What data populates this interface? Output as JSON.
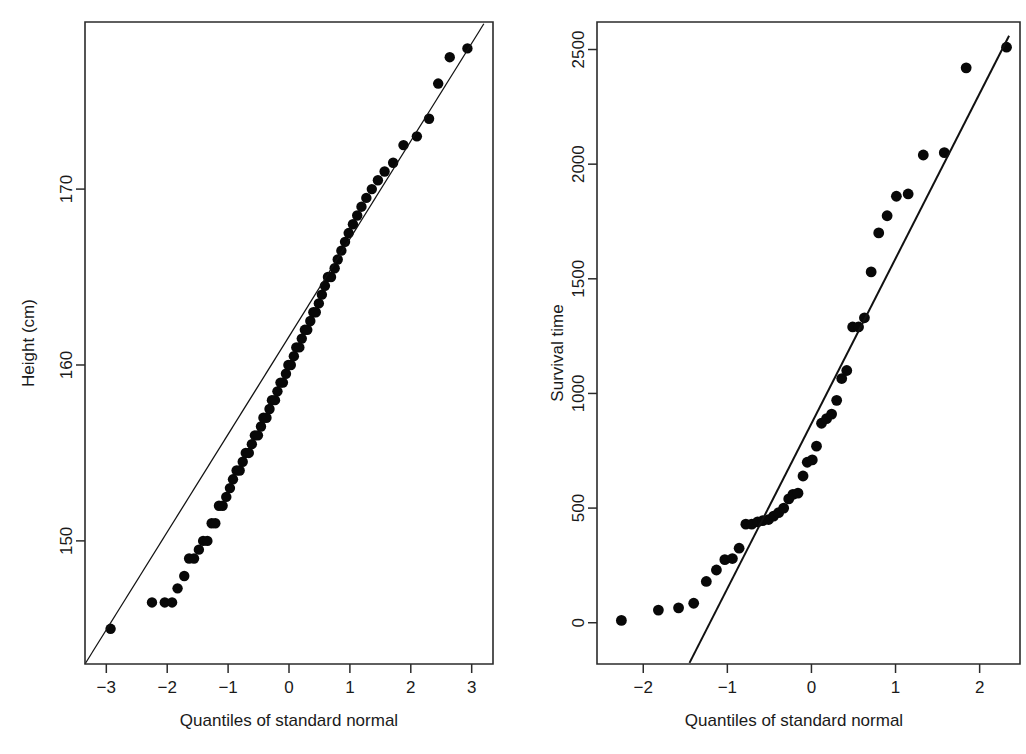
{
  "figure": {
    "background_color": "#ffffff",
    "foreground_color": "#1a1a1a",
    "point_color": "#080808",
    "panels": 2
  },
  "left_panel": {
    "name": "height-qq-plot",
    "x_axis_title": "Quantiles of standard normal",
    "y_axis_title": "Height (cm)",
    "x_tick_labels": [
      "-3",
      "-2",
      "-1",
      "0",
      "1",
      "2",
      "3"
    ],
    "y_tick_labels": [
      "150",
      "160",
      "170"
    ]
  },
  "right_panel": {
    "name": "survival-time-qq-plot",
    "x_axis_title": "Quantiles of standard normal",
    "y_axis_title": "Survival time",
    "x_tick_labels": [
      "-2",
      "-1",
      "0",
      "1",
      "2"
    ],
    "y_tick_labels": [
      "0",
      "500",
      "1000",
      "1500",
      "2000",
      "2500"
    ]
  },
  "chart_data": [
    {
      "type": "scatter",
      "title": "",
      "panel": "left",
      "xlabel": "Quantiles of standard normal",
      "ylabel": "Height (cm)",
      "xlim": [
        -3.35,
        3.35
      ],
      "ylim": [
        143.0,
        179.5
      ],
      "xticks": [
        -3,
        -2,
        -1,
        0,
        1,
        2,
        3
      ],
      "yticks": [
        150,
        160,
        170
      ],
      "grid": false,
      "legend": "none",
      "reference_line": {
        "type": "qq-line",
        "x_start": -3.35,
        "y_start": 143.0,
        "x_end": 3.2,
        "y_end": 179.4,
        "slope": 5.56,
        "intercept": 161.6
      },
      "x": [
        -2.93,
        -2.25,
        -2.04,
        -1.92,
        -1.83,
        -1.72,
        -1.64,
        -1.56,
        -1.48,
        -1.41,
        -1.34,
        -1.27,
        -1.21,
        -1.15,
        -1.09,
        -1.03,
        -0.97,
        -0.92,
        -0.86,
        -0.81,
        -0.76,
        -0.71,
        -0.66,
        -0.61,
        -0.56,
        -0.51,
        -0.46,
        -0.42,
        -0.37,
        -0.32,
        -0.28,
        -0.23,
        -0.19,
        -0.14,
        -0.1,
        -0.05,
        -0.01,
        0.03,
        0.08,
        0.12,
        0.17,
        0.21,
        0.26,
        0.3,
        0.35,
        0.4,
        0.44,
        0.49,
        0.54,
        0.59,
        0.64,
        0.69,
        0.75,
        0.8,
        0.86,
        0.92,
        0.98,
        1.05,
        1.12,
        1.19,
        1.27,
        1.36,
        1.46,
        1.57,
        1.71,
        1.88,
        2.1,
        2.3,
        2.45,
        2.64,
        2.93
      ],
      "y": [
        145.0,
        146.5,
        146.5,
        146.5,
        147.3,
        148.0,
        149.0,
        149.0,
        149.5,
        150.0,
        150.0,
        151.0,
        151.0,
        152.0,
        152.0,
        152.5,
        153.0,
        153.5,
        154.0,
        154.0,
        154.5,
        155.0,
        155.0,
        155.5,
        156.0,
        156.0,
        156.5,
        157.0,
        157.0,
        157.5,
        158.0,
        158.0,
        158.5,
        159.0,
        159.0,
        159.5,
        160.0,
        160.0,
        160.5,
        161.0,
        161.0,
        161.5,
        162.0,
        162.0,
        162.5,
        163.0,
        163.0,
        163.5,
        164.0,
        164.5,
        165.0,
        165.0,
        165.5,
        166.0,
        166.5,
        167.0,
        167.5,
        168.0,
        168.5,
        169.0,
        169.5,
        170.0,
        170.5,
        171.0,
        171.5,
        172.5,
        173.0,
        174.0,
        176.0,
        177.5,
        178.0
      ],
      "note": "Heights cluster at discrete values producing horizontal bands of overlapping markers"
    },
    {
      "type": "scatter",
      "title": "",
      "panel": "right",
      "xlabel": "Quantiles of standard normal",
      "ylabel": "Survival time",
      "xlim": [
        -2.55,
        2.48
      ],
      "ylim": [
        -180,
        2620
      ],
      "xticks": [
        -2,
        -1,
        0,
        1,
        2
      ],
      "yticks": [
        0,
        500,
        1000,
        1500,
        2000,
        2500
      ],
      "grid": false,
      "legend": "none",
      "reference_line": {
        "type": "qq-line",
        "x_start": -1.45,
        "y_start": -175,
        "x_end": 2.35,
        "y_end": 2560,
        "slope": 720,
        "intercept": 870
      },
      "x": [
        -2.26,
        -1.82,
        -1.58,
        -1.4,
        -1.25,
        -1.13,
        -1.03,
        -0.94,
        -0.86,
        -0.78,
        -0.71,
        -0.64,
        -0.58,
        -0.51,
        -0.45,
        -0.39,
        -0.33,
        -0.27,
        -0.22,
        -0.16,
        -0.1,
        -0.05,
        0.01,
        0.06,
        0.12,
        0.18,
        0.24,
        0.3,
        0.36,
        0.42,
        0.49,
        0.56,
        0.63,
        0.71,
        0.8,
        0.9,
        1.01,
        1.15,
        1.33,
        1.58,
        1.84,
        2.32
      ],
      "y": [
        10,
        55,
        65,
        85,
        180,
        230,
        275,
        280,
        325,
        430,
        430,
        440,
        445,
        450,
        465,
        480,
        500,
        540,
        560,
        565,
        640,
        700,
        710,
        770,
        870,
        890,
        910,
        970,
        1065,
        1100,
        1290,
        1290,
        1330,
        1530,
        1700,
        1775,
        1860,
        1870,
        2040,
        2050,
        2420,
        2510
      ],
      "note": "S-shaped departure from normality; heavy right tail"
    }
  ]
}
